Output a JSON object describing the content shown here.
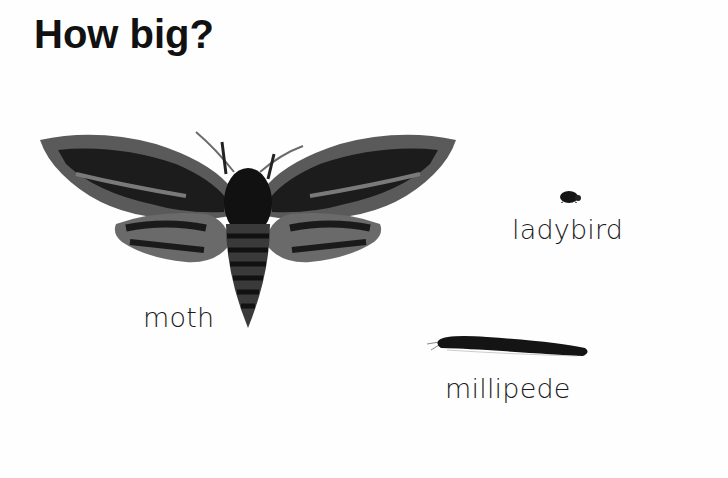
{
  "page": {
    "title": "How big?",
    "creatures": [
      {
        "name": "moth",
        "label": "moth"
      },
      {
        "name": "ladybird",
        "label": "ladybird"
      },
      {
        "name": "millipede",
        "label": "millipede"
      }
    ]
  },
  "colors": {
    "background": "#fefefe",
    "text": "#111111",
    "creature_dark": "#151515",
    "creature_mid": "#5a5a5a",
    "creature_light": "#8a8a8a"
  }
}
